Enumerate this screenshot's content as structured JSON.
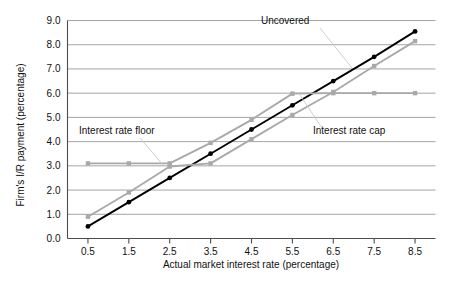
{
  "chart_data": {
    "type": "line",
    "title": "",
    "xlabel": "Actual market interest rate (percentage)",
    "ylabel": "Firm's I/R payment (percentage)",
    "x": [
      0.5,
      1.5,
      2.5,
      3.5,
      4.5,
      5.5,
      6.5,
      7.5,
      8.5
    ],
    "xticklabels": [
      "0.5",
      "1.5",
      "2.5",
      "3.5",
      "4.5",
      "5.5",
      "6.5",
      "7.5",
      "8.5"
    ],
    "yticklabels": [
      "0.0",
      "1.0",
      "2.0",
      "3.0",
      "4.0",
      "5.0",
      "6.0",
      "7.0",
      "8.0",
      "9.0"
    ],
    "yticks": [
      0.0,
      1.0,
      2.0,
      3.0,
      4.0,
      5.0,
      6.0,
      7.0,
      8.0,
      9.0
    ],
    "xlim": [
      0.0,
      9.0
    ],
    "ylim": [
      0.0,
      9.0
    ],
    "grid": "horizontal",
    "legend": "none",
    "series": [
      {
        "name": "Uncovered",
        "color": "#000000",
        "marker": "circle",
        "values": [
          0.5,
          1.5,
          2.5,
          3.5,
          4.5,
          5.5,
          6.5,
          7.5,
          8.55
        ]
      },
      {
        "name": "Interest rate floor",
        "color": "#a9a9a9",
        "marker": "square",
        "values": [
          3.1,
          3.1,
          3.1,
          3.95,
          4.9,
          5.98,
          6.0,
          6.0,
          6.0
        ]
      },
      {
        "name": "Interest rate cap",
        "color": "#a9a9a9",
        "marker": "square",
        "values": [
          0.9,
          1.9,
          2.97,
          3.1,
          4.1,
          5.1,
          6.05,
          7.12,
          8.15
        ]
      }
    ],
    "annotations": [
      {
        "label": "Uncovered",
        "text_x": 261,
        "text_y": 24,
        "anchor": "start",
        "leader": [
          [
            320,
            28
          ],
          [
            352,
            68
          ]
        ]
      },
      {
        "label": "Interest rate floor",
        "text_x": 79,
        "text_y": 134,
        "anchor": "start",
        "leader": [
          [
            140,
            138
          ],
          [
            163,
            165
          ]
        ]
      },
      {
        "label": "Interest rate cap",
        "text_x": 313,
        "text_y": 134,
        "anchor": "start",
        "leader": [
          [
            322,
            128
          ],
          [
            300,
            95
          ]
        ]
      }
    ]
  }
}
